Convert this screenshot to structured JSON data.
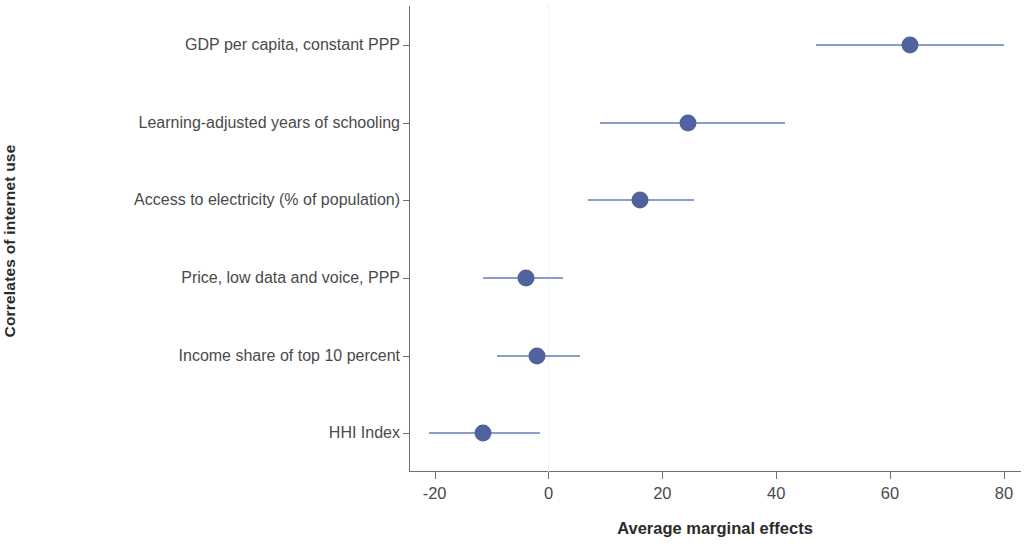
{
  "chart_data": {
    "type": "scatter",
    "title": "",
    "subtitle": "",
    "xlabel": "Average marginal effects",
    "ylabel": "Correlates of internet use",
    "xlim": [
      -24.5,
      83.0
    ],
    "xticks": [
      -20,
      0,
      20,
      40,
      60,
      80
    ],
    "xticklabels": [
      "-20",
      "0",
      "20",
      "40",
      "60",
      "80"
    ],
    "grid": false,
    "legend": null,
    "zero_reference_line": 0,
    "orientation": "horizontal",
    "marker_style": "filled-circle-with-confidence-interval",
    "categories": [
      "GDP per capita, constant PPP",
      "Learning-adjusted years of schooling",
      "Access to electricity (% of population)",
      "Price, low data and voice, PPP",
      "Income share of top 10 percent",
      "HHI Index"
    ],
    "values": [
      63.5,
      24.5,
      16.0,
      -4.0,
      -2.0,
      -11.5
    ],
    "ci_low": [
      47.0,
      9.0,
      7.0,
      -11.5,
      -9.0,
      -21.0
    ],
    "ci_high": [
      80.0,
      41.5,
      25.5,
      2.5,
      5.5,
      -1.5
    ],
    "points": [
      {
        "label": "GDP per capita, constant PPP",
        "value": 63.5,
        "ci_low": 47.0,
        "ci_high": 80.0
      },
      {
        "label": "Learning-adjusted years of schooling",
        "value": 24.5,
        "ci_low": 9.0,
        "ci_high": 41.5
      },
      {
        "label": "Access to electricity (% of population)",
        "value": 16.0,
        "ci_low": 7.0,
        "ci_high": 25.5
      },
      {
        "label": "Price, low data and voice, PPP",
        "value": -4.0,
        "ci_low": -11.5,
        "ci_high": 2.5
      },
      {
        "label": "Income share of top 10 percent",
        "value": -2.0,
        "ci_low": -9.0,
        "ci_high": 5.5
      },
      {
        "label": "HHI Index",
        "value": -11.5,
        "ci_low": -21.0,
        "ci_high": -1.5
      }
    ],
    "colors": {
      "point": "#51639f",
      "interval": "#8c9ccd",
      "axis": "#6f6f6f",
      "zero_line": "#d8f2f2",
      "text": "#4a4a4a",
      "title_text": "#2b2b2b",
      "background": "#ffffff"
    }
  }
}
